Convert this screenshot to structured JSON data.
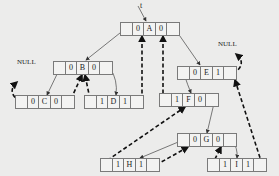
{
  "diagram": {
    "root_label": "t",
    "null_label": "NULL",
    "nodes": {
      "A": {
        "ltag": "0",
        "data": "A",
        "rtag": "0"
      },
      "B": {
        "ltag": "0",
        "data": "B",
        "rtag": "0"
      },
      "C": {
        "ltag": "0",
        "data": "C",
        "rtag": "0"
      },
      "D": {
        "ltag": "1",
        "data": "D",
        "rtag": "1"
      },
      "E": {
        "ltag": "0",
        "data": "E",
        "rtag": "1"
      },
      "F": {
        "ltag": "1",
        "data": "F",
        "rtag": "0"
      },
      "G": {
        "ltag": "0",
        "data": "G",
        "rtag": "0"
      },
      "H": {
        "ltag": "1",
        "data": "H",
        "rtag": "1"
      },
      "I": {
        "ltag": "1",
        "data": "I",
        "rtag": "1"
      }
    },
    "edges": [
      {
        "from": "A",
        "to": "B",
        "type": "child"
      },
      {
        "from": "A",
        "to": "E",
        "type": "child"
      },
      {
        "from": "B",
        "to": "C",
        "type": "child"
      },
      {
        "from": "B",
        "to": "D",
        "type": "child"
      },
      {
        "from": "E",
        "to": "F",
        "type": "child"
      },
      {
        "from": "F",
        "to": "G",
        "type": "child"
      },
      {
        "from": "G",
        "to": "H",
        "type": "child"
      },
      {
        "from": "G",
        "to": "I",
        "type": "child"
      },
      {
        "from": "C",
        "to": "NULL",
        "type": "thread"
      },
      {
        "from": "C",
        "to": "B",
        "type": "thread"
      },
      {
        "from": "D",
        "to": "B",
        "type": "thread"
      },
      {
        "from": "D",
        "to": "A",
        "type": "thread"
      },
      {
        "from": "F",
        "to": "A",
        "type": "thread"
      },
      {
        "from": "H",
        "to": "F",
        "type": "thread"
      },
      {
        "from": "H",
        "to": "G",
        "type": "thread"
      },
      {
        "from": "I",
        "to": "G",
        "type": "thread"
      },
      {
        "from": "I",
        "to": "E",
        "type": "thread"
      },
      {
        "from": "E",
        "to": "NULL",
        "type": "thread"
      }
    ]
  }
}
